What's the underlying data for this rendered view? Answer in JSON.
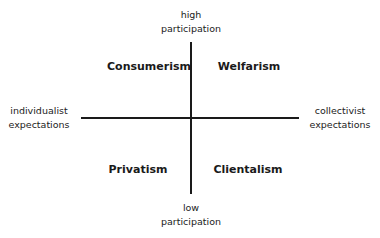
{
  "diagram": {
    "type": "quadrant",
    "axes": {
      "vertical": {
        "top_label": [
          "high",
          "participation"
        ],
        "bottom_label": [
          "low",
          "participation"
        ]
      },
      "horizontal": {
        "left_label": [
          "individualist",
          "expectations"
        ],
        "right_label": [
          "collectivist",
          "expectations"
        ]
      }
    },
    "quadrants": {
      "top_left": "Consumerism",
      "top_right": "Welfarism",
      "bottom_left": "Privatism",
      "bottom_right": "Clientalism"
    },
    "colors": {
      "line": "#1a1a1a",
      "text": "#1a1a1a",
      "background": "#ffffff"
    }
  }
}
